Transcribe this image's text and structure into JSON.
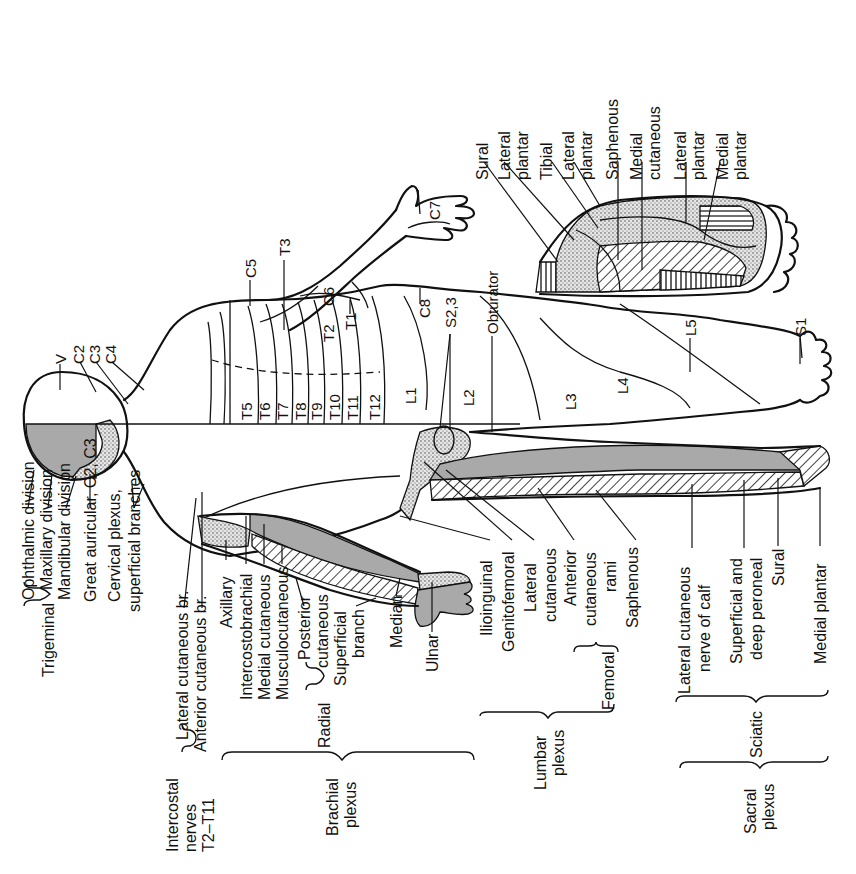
{
  "figure": {
    "orientation": "rotated 90 degrees counter-clockwise; head at left, feet at right",
    "colors": {
      "ink": "#111111",
      "shade": "#a9a9a9",
      "background": "#ffffff"
    }
  },
  "dermatomes": {
    "head": [
      "V",
      "C2",
      "C3",
      "C4"
    ],
    "arm": [
      "C5",
      "T3",
      "C6",
      "T2",
      "T1",
      "C7",
      "C8"
    ],
    "trunk": [
      "T5",
      "T6",
      "T7",
      "T8",
      "T9",
      "T10",
      "T11",
      "T12",
      "L1"
    ],
    "perineum": "S2,3",
    "leg": [
      "L2",
      "L3",
      "L4",
      "L5",
      "S1"
    ],
    "obturator": "Obturator"
  },
  "foot_detail": {
    "labels": [
      "Sural",
      "Lateral plantar",
      "Tibial",
      "Lateral plantar",
      "Saphenous",
      "Medial cutaneous",
      "Lateral plantar",
      "Medial plantar"
    ],
    "lines": [
      [
        "Sural"
      ],
      [
        "Lateral",
        "plantar"
      ],
      [
        "Tibial"
      ],
      [
        "Lateral",
        "plantar"
      ],
      [
        "Saphenous"
      ],
      [
        "Medial",
        "cutaneous"
      ],
      [
        "Lateral",
        "plantar"
      ],
      [
        "Medial",
        "plantar"
      ]
    ]
  },
  "nerve_labels": {
    "trigeminal": {
      "group": "Trigeminal",
      "items": [
        "Ophthalmic division",
        "Maxillary division",
        "Mandibular division"
      ]
    },
    "great_auricular": "Great auricular, C2, C3",
    "cervical_plexus": [
      "Cervical plexus,",
      "superficial branches"
    ],
    "intercostal": {
      "group": [
        "Intercostal",
        "nerves",
        "T2–T11"
      ],
      "items": [
        "Lateral cutaneous br.",
        "Anterior cutaneous br."
      ]
    },
    "brachial_plexus": {
      "group": [
        "Brachial",
        "plexus"
      ],
      "items": [
        "Axillary",
        "Intercostobrachial",
        "Medial cutaneous",
        "Musculocutaneous"
      ],
      "radial": {
        "group": "Radial",
        "items": [
          [
            "Posterior",
            "cutaneous"
          ],
          [
            "Superficial",
            "branch"
          ]
        ]
      },
      "median": "Median",
      "ulnar": "Ulnar"
    },
    "lumbar_plexus": {
      "group": [
        "Lumbar",
        "plexus"
      ],
      "items": [
        "Ilioinguinal",
        "Genitofemoral",
        [
          "Lateral",
          "cutaneous"
        ]
      ],
      "femoral": {
        "group": "Femoral",
        "items": [
          [
            "Anterior",
            "cutaneous",
            "rami"
          ],
          "Saphenous"
        ]
      }
    },
    "sacral_plexus": {
      "group": [
        "Sacral",
        "plexus"
      ],
      "sciatic": {
        "group": "Sciatic",
        "items": [
          [
            "Lateral cutaneous",
            "nerve of calf"
          ],
          [
            "Superficial and",
            "deep peroneal"
          ],
          "Sural"
        ]
      },
      "medial_plantar": "Medial plantar"
    }
  }
}
